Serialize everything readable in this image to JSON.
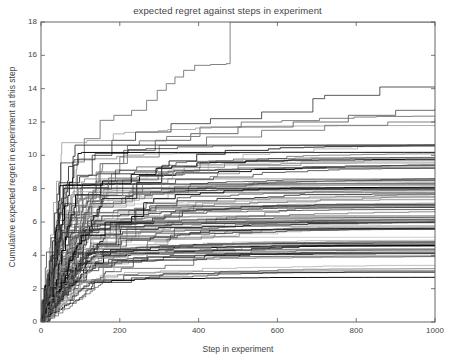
{
  "chart_data": {
    "type": "line",
    "title": "expected regret against steps in experiment",
    "xlabel": "Step in experiment",
    "ylabel": "Cumulative expected regret in experiment at this step",
    "xlim": [
      0,
      1000
    ],
    "ylim": [
      0,
      18
    ],
    "xticks": [
      0,
      200,
      400,
      600,
      800,
      1000
    ],
    "yticks": [
      0,
      2,
      4,
      6,
      8,
      10,
      12,
      14,
      16,
      18
    ],
    "xtick_labels": [
      "0",
      "200",
      "400",
      "600",
      "800",
      "1000"
    ],
    "ytick_labels": [
      "0",
      "2",
      "4",
      "6",
      "8",
      "10",
      "12",
      "14",
      "16",
      "18"
    ],
    "grid": false,
    "legend": null,
    "step_style": "post",
    "n_series": 100,
    "line_colors": [
      "#000000",
      "#222222",
      "#3d3d3d",
      "#5a5a5a",
      "#787878",
      "#969696",
      "#ababab"
    ],
    "series": [
      {
        "name": "run-top-outlier",
        "final_value": 18.0,
        "x": [
          0,
          6,
          14,
          26,
          40,
          58,
          80,
          110,
          150,
          185,
          230,
          268,
          295,
          318,
          340,
          362,
          390,
          430,
          470,
          480,
          1000
        ],
        "y": [
          0,
          1.2,
          2.6,
          4.2,
          6.1,
          8.0,
          9.6,
          11.0,
          12.1,
          12.4,
          12.7,
          13.3,
          13.9,
          14.3,
          14.7,
          15.1,
          15.4,
          15.45,
          15.5,
          18.0,
          18.0
        ]
      },
      {
        "name": "run-second-high",
        "final_value": 14.1,
        "x": [
          0,
          8,
          20,
          36,
          60,
          92,
          130,
          180,
          240,
          330,
          430,
          560,
          690,
          720,
          860,
          1000
        ],
        "y": [
          0,
          1.4,
          3.0,
          5.0,
          7.1,
          8.8,
          10.0,
          10.9,
          11.4,
          11.9,
          12.2,
          12.6,
          13.4,
          13.6,
          14.1,
          14.1
        ]
      },
      {
        "name": "run-third-high",
        "final_value": 12.8,
        "x": [
          0,
          10,
          24,
          44,
          70,
          105,
          150,
          210,
          290,
          380,
          500,
          640,
          780,
          900,
          1000
        ],
        "y": [
          0,
          1.1,
          2.7,
          4.6,
          6.6,
          8.3,
          9.5,
          10.3,
          10.9,
          11.3,
          11.7,
          12.0,
          12.4,
          12.7,
          12.8
        ]
      },
      {
        "name": "run-cluster-upper",
        "final_value": 12.2,
        "x": [
          0,
          12,
          30,
          55,
          90,
          140,
          200,
          300,
          420,
          560,
          720,
          880,
          1000
        ],
        "y": [
          0,
          1.3,
          3.2,
          5.4,
          7.4,
          9.0,
          9.9,
          10.6,
          11.1,
          11.5,
          11.8,
          12.0,
          12.2
        ]
      },
      {
        "name": "run-cluster-mid-high",
        "final_value": 9.8,
        "x": [
          0,
          9,
          22,
          42,
          72,
          115,
          170,
          250,
          360,
          500,
          660,
          820,
          1000
        ],
        "y": [
          0,
          1.0,
          2.5,
          4.3,
          6.2,
          7.5,
          8.3,
          8.8,
          9.1,
          9.4,
          9.6,
          9.7,
          9.8
        ]
      },
      {
        "name": "run-cluster-mid",
        "final_value": 7.4,
        "x": [
          0,
          11,
          28,
          52,
          85,
          130,
          195,
          290,
          410,
          550,
          700,
          860,
          1000
        ],
        "y": [
          0,
          0.9,
          2.2,
          3.8,
          5.2,
          6.1,
          6.6,
          6.9,
          7.1,
          7.2,
          7.3,
          7.35,
          7.4
        ]
      },
      {
        "name": "run-cluster-mid-low",
        "final_value": 5.6,
        "x": [
          0,
          14,
          34,
          62,
          100,
          155,
          230,
          340,
          470,
          620,
          780,
          930,
          1000
        ],
        "y": [
          0,
          0.8,
          1.9,
          3.1,
          4.2,
          4.8,
          5.1,
          5.3,
          5.4,
          5.5,
          5.55,
          5.6,
          5.6
        ]
      },
      {
        "name": "run-cluster-low",
        "final_value": 4.1,
        "x": [
          0,
          16,
          38,
          70,
          115,
          180,
          270,
          390,
          530,
          690,
          850,
          1000
        ],
        "y": [
          0,
          0.7,
          1.6,
          2.5,
          3.3,
          3.7,
          3.9,
          4.0,
          4.05,
          4.08,
          4.1,
          4.1
        ]
      },
      {
        "name": "run-lowest",
        "final_value": 3.0,
        "x": [
          0,
          20,
          46,
          84,
          135,
          210,
          310,
          440,
          600,
          770,
          930,
          1000
        ],
        "y": [
          0,
          0.6,
          1.3,
          2.0,
          2.5,
          2.8,
          2.9,
          2.95,
          2.98,
          3.0,
          3.0,
          3.0
        ]
      }
    ]
  },
  "figure": {
    "background_color": "#ffffff",
    "axis_color": "#555555",
    "text_color": "#444444"
  }
}
